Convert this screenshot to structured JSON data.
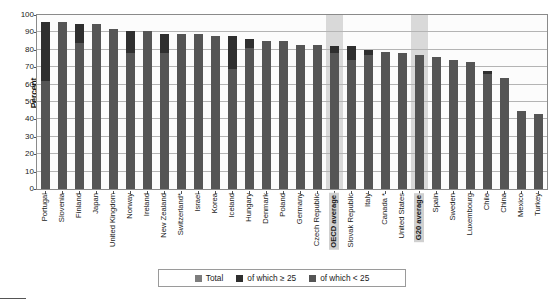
{
  "chart_data": {
    "type": "bar",
    "title": "",
    "subtitle": "",
    "xlabel": "",
    "ylabel": "Percent",
    "ylim": [
      0,
      100
    ],
    "ytick_step": 10,
    "yticks": [
      100,
      90,
      80,
      70,
      60,
      50,
      40,
      30,
      20,
      10,
      0
    ],
    "grid": true,
    "stacked": true,
    "legend_position": "bottom",
    "legend": [
      "Total",
      "of which ≥ 25",
      "of which < 25"
    ],
    "highlighted_categories": [
      "OECD average",
      "G20 average"
    ],
    "categories": [
      "Portugal",
      "Slovenia",
      "Finland",
      "Japan",
      "United Kingdom",
      "Norway",
      "Ireland",
      "New Zealand",
      "Switzerland*",
      "Israel",
      "Korea",
      "Iceland",
      "Hungary",
      "Denmark",
      "Poland",
      "Germany",
      "Czech Republic",
      "OECD average",
      "Slovak Republic",
      "Italy",
      "Canada *",
      "United States",
      "G20 average",
      "Spain",
      "Sweden",
      "Luxembourg",
      "Chile",
      "China",
      "Mexico",
      "Turkey"
    ],
    "series": [
      {
        "name": "Total",
        "values": [
          96,
          96,
          95,
          95,
          92,
          91,
          91,
          89,
          89,
          89,
          88,
          88,
          86,
          85,
          85,
          83,
          83,
          82,
          82,
          80,
          79,
          78,
          77,
          76,
          74,
          73,
          68,
          64,
          45,
          43
        ]
      },
      {
        "name": "of which ≥ 25",
        "values": [
          34,
          0,
          11,
          0,
          0,
          13,
          0,
          11,
          0,
          0,
          0,
          19,
          5,
          0,
          0,
          0,
          0,
          4,
          8,
          3,
          0,
          0,
          0,
          0,
          0,
          0,
          2,
          0,
          0,
          0
        ]
      },
      {
        "name": "of which < 25",
        "values": [
          62,
          96,
          84,
          95,
          92,
          78,
          91,
          78,
          89,
          89,
          88,
          69,
          81,
          85,
          85,
          83,
          83,
          78,
          74,
          77,
          79,
          78,
          77,
          76,
          74,
          73,
          66,
          64,
          45,
          43
        ]
      }
    ],
    "colors": {
      "total": "#7d7d7d",
      "ge25": "#2f2f2f",
      "lt25": "#555555",
      "highlight_band": "#d9d9d9",
      "gridline": "#b4b4b4",
      "axis": "#8a8a8a",
      "text": "#1a1a1a",
      "plot_background": "#fcfcfc"
    }
  }
}
